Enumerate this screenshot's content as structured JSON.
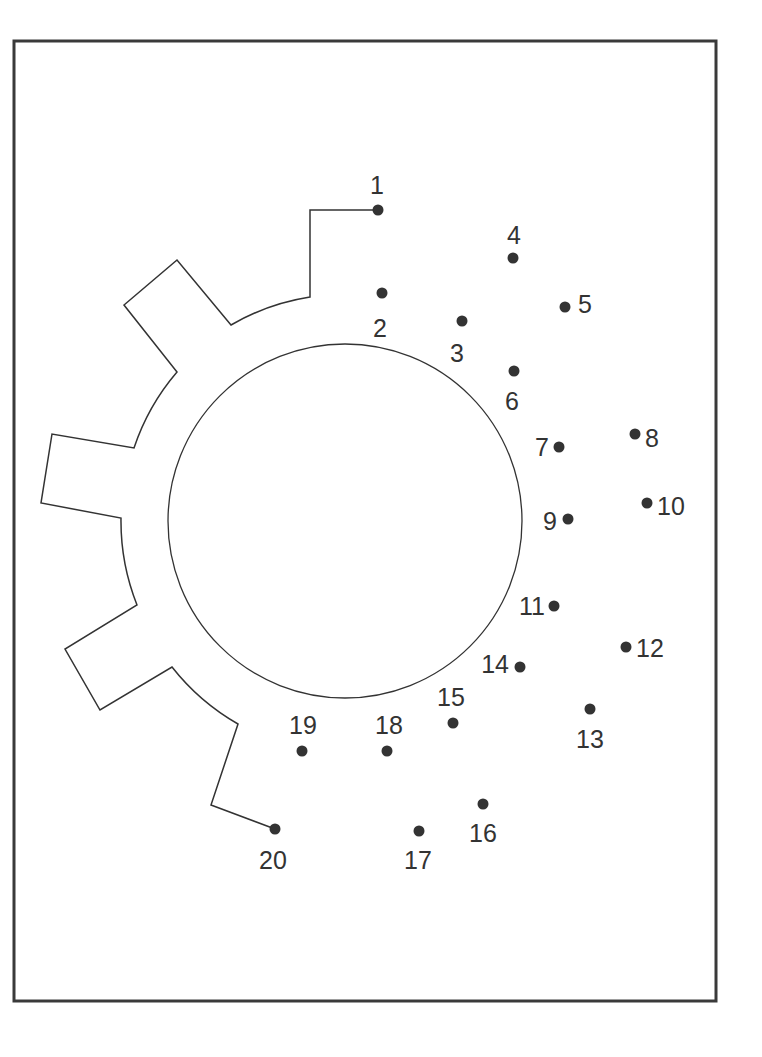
{
  "worksheet": {
    "type": "connect-the-dots",
    "subject": "gear",
    "frame": {
      "x": 13,
      "y": 40,
      "width": 704,
      "height": 962,
      "stroke": "#3a3a3a"
    },
    "ink_color": "#333333",
    "inner_circle": {
      "cx": 345,
      "cy": 521,
      "rx": 175,
      "ry": 180
    },
    "gear_outline_points": "378,210 310,210 310,297",
    "dots": [
      {
        "n": "1",
        "x": 378,
        "y": 210,
        "lx": 377,
        "ly": 194,
        "anchor": "middle"
      },
      {
        "n": "2",
        "x": 382,
        "y": 293,
        "lx": 380,
        "ly": 337,
        "anchor": "middle"
      },
      {
        "n": "3",
        "x": 462,
        "y": 321,
        "lx": 457,
        "ly": 362,
        "anchor": "middle"
      },
      {
        "n": "4",
        "x": 513,
        "y": 258,
        "lx": 514,
        "ly": 244,
        "anchor": "middle"
      },
      {
        "n": "5",
        "x": 565,
        "y": 307,
        "lx": 578,
        "ly": 313,
        "anchor": "start"
      },
      {
        "n": "6",
        "x": 514,
        "y": 371,
        "lx": 512,
        "ly": 410,
        "anchor": "middle"
      },
      {
        "n": "7",
        "x": 559,
        "y": 447,
        "lx": 549,
        "ly": 456,
        "anchor": "end"
      },
      {
        "n": "8",
        "x": 635,
        "y": 434,
        "lx": 645,
        "ly": 447,
        "anchor": "start"
      },
      {
        "n": "9",
        "x": 568,
        "y": 519,
        "lx": 557,
        "ly": 530,
        "anchor": "end"
      },
      {
        "n": "10",
        "x": 647,
        "y": 503,
        "lx": 657,
        "ly": 515,
        "anchor": "start"
      },
      {
        "n": "11",
        "x": 554,
        "y": 606,
        "lx": 545,
        "ly": 615,
        "anchor": "end"
      },
      {
        "n": "12",
        "x": 626,
        "y": 647,
        "lx": 636,
        "ly": 657,
        "anchor": "start"
      },
      {
        "n": "13",
        "x": 590,
        "y": 709,
        "lx": 590,
        "ly": 748,
        "anchor": "middle"
      },
      {
        "n": "14",
        "x": 520,
        "y": 667,
        "lx": 509,
        "ly": 673,
        "anchor": "end"
      },
      {
        "n": "15",
        "x": 453,
        "y": 723,
        "lx": 451,
        "ly": 706,
        "anchor": "middle"
      },
      {
        "n": "16",
        "x": 483,
        "y": 804,
        "lx": 483,
        "ly": 842,
        "anchor": "middle"
      },
      {
        "n": "17",
        "x": 419,
        "y": 831,
        "lx": 418,
        "ly": 869,
        "anchor": "middle"
      },
      {
        "n": "18",
        "x": 387,
        "y": 751,
        "lx": 389,
        "ly": 734,
        "anchor": "middle"
      },
      {
        "n": "19",
        "x": 302,
        "y": 751,
        "lx": 303,
        "ly": 734,
        "anchor": "middle"
      },
      {
        "n": "20",
        "x": 275,
        "y": 829,
        "lx": 273,
        "ly": 869,
        "anchor": "middle"
      }
    ]
  }
}
